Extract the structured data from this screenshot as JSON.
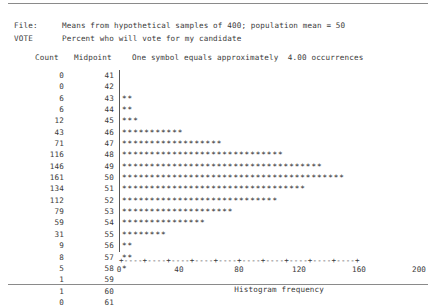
{
  "report": {
    "file_label": "File:",
    "file_value": "Means from hypothetical samples of 400; population mean = 50",
    "variable_label": "VOTE",
    "variable_value": "Percent who will vote for my candidate",
    "column_headers": {
      "count": "Count",
      "midpoint": "Midpoint",
      "symbol_note": "One symbol equals approximately  4.00 occurrences"
    },
    "symbol_scale": 4.0,
    "symbol_char": "*"
  },
  "chart_data": {
    "type": "bar",
    "orientation": "horizontal",
    "title": "Means from hypothetical samples of 400; population mean = 50",
    "subtitle": "Percent who will vote for my candidate",
    "xlabel": "Histogram frequency",
    "ylabel": "Midpoint",
    "xlim": [
      0,
      200
    ],
    "xticks": [
      0,
      20,
      40,
      60,
      80,
      100,
      120,
      140,
      160,
      180,
      200
    ],
    "xtick_labels": [
      "0",
      "",
      "40",
      "",
      "80",
      "",
      "120",
      "",
      "160",
      "",
      "200"
    ],
    "grid": false,
    "legend": null,
    "categories": [
      41,
      42,
      43,
      44,
      45,
      46,
      47,
      48,
      49,
      50,
      51,
      52,
      53,
      54,
      55,
      56,
      57,
      58,
      59,
      60,
      61
    ],
    "values": [
      0,
      0,
      6,
      6,
      12,
      43,
      71,
      116,
      146,
      161,
      134,
      112,
      79,
      59,
      31,
      9,
      8,
      5,
      1,
      1,
      0
    ],
    "symbols_per_row": [
      0,
      0,
      2,
      2,
      3,
      11,
      18,
      29,
      36,
      40,
      33,
      28,
      20,
      15,
      8,
      2,
      2,
      1,
      0,
      0,
      0
    ],
    "rows": [
      {
        "count": "0",
        "midpoint": "41",
        "symbols": ""
      },
      {
        "count": "0",
        "midpoint": "42",
        "symbols": ""
      },
      {
        "count": "6",
        "midpoint": "43",
        "symbols": "**"
      },
      {
        "count": "6",
        "midpoint": "44",
        "symbols": "**"
      },
      {
        "count": "12",
        "midpoint": "45",
        "symbols": "***"
      },
      {
        "count": "43",
        "midpoint": "46",
        "symbols": "***********"
      },
      {
        "count": "71",
        "midpoint": "47",
        "symbols": "******************"
      },
      {
        "count": "116",
        "midpoint": "48",
        "symbols": "*****************************"
      },
      {
        "count": "146",
        "midpoint": "49",
        "symbols": "************************************"
      },
      {
        "count": "161",
        "midpoint": "50",
        "symbols": "****************************************"
      },
      {
        "count": "134",
        "midpoint": "51",
        "symbols": "*********************************"
      },
      {
        "count": "112",
        "midpoint": "52",
        "symbols": "****************************"
      },
      {
        "count": "79",
        "midpoint": "53",
        "symbols": "********************"
      },
      {
        "count": "59",
        "midpoint": "54",
        "symbols": "***************"
      },
      {
        "count": "31",
        "midpoint": "55",
        "symbols": "********"
      },
      {
        "count": "9",
        "midpoint": "56",
        "symbols": "**"
      },
      {
        "count": "8",
        "midpoint": "57",
        "symbols": "**"
      },
      {
        "count": "5",
        "midpoint": "58",
        "symbols": "*"
      },
      {
        "count": "1",
        "midpoint": "59",
        "symbols": ""
      },
      {
        "count": "1",
        "midpoint": "60",
        "symbols": ""
      },
      {
        "count": "0",
        "midpoint": "61",
        "symbols": ""
      }
    ]
  },
  "axis": {
    "line": "+----+----+----+----+----+----+----+----+----+----+",
    "ticks": [
      {
        "value": 0,
        "label": "0",
        "pos_pct": 0
      },
      {
        "value": 40,
        "label": "40",
        "pos_pct": 20
      },
      {
        "value": 80,
        "label": "80",
        "pos_pct": 40
      },
      {
        "value": 120,
        "label": "120",
        "pos_pct": 60
      },
      {
        "value": 160,
        "label": "160",
        "pos_pct": 80
      },
      {
        "value": 200,
        "label": "200",
        "pos_pct": 100
      }
    ],
    "title": "Histogram frequency"
  }
}
